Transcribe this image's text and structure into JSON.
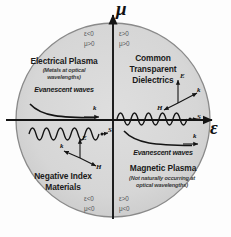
{
  "figure": {
    "name": "permittivity-permeability-quadrant-diagram",
    "axes": {
      "vertical_label": "μ",
      "horizontal_label": "ε"
    },
    "colors": {
      "circle_fill": "#d8d8d8",
      "circle_fill_alt": "#cfcfcf",
      "circle_stroke": "#8a8a8a",
      "axis": "#141414",
      "text": "#1a1a1a",
      "condition_text": "#55575a",
      "background": "#fdfdfd"
    }
  },
  "quadrants": {
    "upper_left": {
      "title": "Electrical Plasma",
      "subtitle": "(Metals at optical wavelengths)",
      "wave_label": "Evanescent waves",
      "epsilon": "ε<0",
      "mu": "μ>0",
      "wave_type": "evanescent-decay",
      "vector_labels": [
        "k"
      ]
    },
    "upper_right": {
      "title": "Common Transparent Dielectrics",
      "subtitle": "",
      "wave_label": "",
      "epsilon": "ε>0",
      "mu": "μ>0",
      "wave_type": "propagating-sinusoid",
      "vector_labels": [
        "E",
        "k",
        "H",
        "S"
      ]
    },
    "lower_left": {
      "title": "Negative Index Materials",
      "subtitle": "",
      "wave_label": "",
      "epsilon": "ε<0",
      "mu": "μ<0",
      "wave_type": "propagating-sinusoid",
      "vector_labels": [
        "S",
        "E",
        "k",
        "H"
      ]
    },
    "lower_right": {
      "title": "Magnetic Plasma",
      "subtitle": "(Not naturally occurring at optical wavelengths)",
      "wave_label": "Evanescent waves",
      "epsilon": "ε>0",
      "mu": "μ<0",
      "wave_type": "evanescent-decay",
      "vector_labels": [
        "k"
      ]
    }
  },
  "titles": {
    "ur_line1": "Common",
    "ur_line2": "Transparent",
    "ur_line3": "Dielectrics",
    "ll_line1": "Negative Index",
    "ll_line2": "Materials",
    "ul_sub1": "(Metals at optical",
    "ul_sub2": "wavelengths)",
    "lr_sub1": "(Not naturally occurring at",
    "lr_sub2": "optical wavelengths)"
  },
  "vectors": {
    "ul_k": "k",
    "ur_E": "E",
    "ur_k": "k",
    "ur_H": "H",
    "ur_S": "S",
    "ll_S": "S",
    "ll_E": "E",
    "ll_k": "k",
    "ll_H": "H",
    "lr_k": "k"
  }
}
